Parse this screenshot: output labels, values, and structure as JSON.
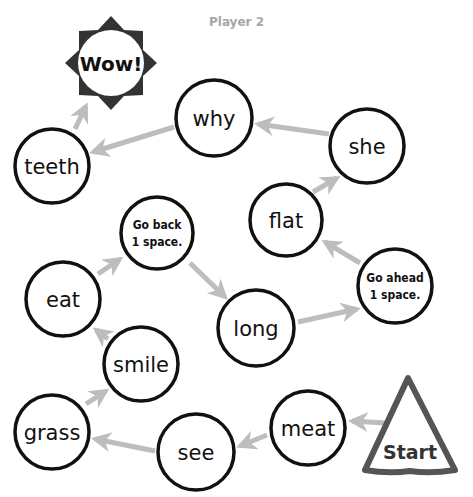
{
  "header": {
    "player_label": "Player 2"
  },
  "colors": {
    "arrow": "#bdbdbd",
    "circle_stroke": "#111111",
    "start_stroke": "#555555",
    "star_fill": "#333333",
    "title": "#a6a6a6"
  },
  "spaces": [
    {
      "id": "start",
      "label": "Start",
      "shape": "triangle"
    },
    {
      "id": "meat",
      "label": "meat",
      "shape": "circle"
    },
    {
      "id": "see",
      "label": "see",
      "shape": "circle"
    },
    {
      "id": "grass",
      "label": "grass",
      "shape": "circle"
    },
    {
      "id": "smile",
      "label": "smile",
      "shape": "circle"
    },
    {
      "id": "eat",
      "label": "eat",
      "shape": "circle"
    },
    {
      "id": "go-back",
      "label_lines": [
        "Go back",
        "1 space."
      ],
      "shape": "circle"
    },
    {
      "id": "long",
      "label": "long",
      "shape": "circle"
    },
    {
      "id": "go-ahead",
      "label_lines": [
        "Go ahead",
        "1 space."
      ],
      "shape": "circle"
    },
    {
      "id": "flat",
      "label": "flat",
      "shape": "circle"
    },
    {
      "id": "she",
      "label": "she",
      "shape": "circle"
    },
    {
      "id": "why",
      "label": "why",
      "shape": "circle"
    },
    {
      "id": "teeth",
      "label": "teeth",
      "shape": "circle"
    },
    {
      "id": "wow",
      "label": "Wow!",
      "shape": "starburst"
    }
  ],
  "path_order": [
    "start",
    "meat",
    "see",
    "grass",
    "smile",
    "eat",
    "go-back",
    "long",
    "go-ahead",
    "flat",
    "she",
    "why",
    "teeth",
    "wow"
  ]
}
